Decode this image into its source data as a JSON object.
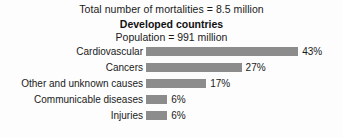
{
  "chart_data": {
    "type": "bar",
    "orientation": "horizontal",
    "title": "Total number of mortalities = 8.5 million",
    "subtitle": "Developed countries",
    "subnote": "Population = 991 million",
    "xlabel": "",
    "ylabel": "",
    "grid": false,
    "legend": "none",
    "xlim": [
      0,
      43
    ],
    "unit": "%",
    "bar_color": "#8c8c8c",
    "categories": [
      "Cardiovascular",
      "Cancers",
      "Other and unknown causes",
      "Communicable diseases",
      "Injuries"
    ],
    "values": [
      43,
      27,
      17,
      6,
      6
    ],
    "value_labels": [
      "43%",
      "27%",
      "17%",
      "6%",
      "6%"
    ]
  }
}
